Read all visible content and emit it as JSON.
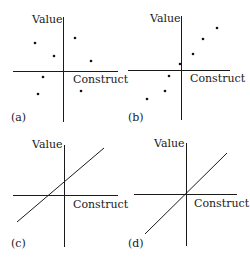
{
  "figure": {
    "y_axis_label": "Value",
    "x_axis_label": "Construct",
    "panels": [
      {
        "id": "a",
        "label": "(a)",
        "type": "scatter",
        "description": "no relationship",
        "axes": {
          "vx": 63,
          "vy1": 17,
          "vy2": 122,
          "hy": 71,
          "hx1": 13,
          "hx2": 118
        },
        "value_label_pos": {
          "x": 32,
          "y": 23
        },
        "construct_label_pos": {
          "x": 73,
          "y": 83
        },
        "panel_label_pos": {
          "x": 11,
          "y": 121
        },
        "points": [
          [
            35,
            43
          ],
          [
            54,
            56
          ],
          [
            75,
            38
          ],
          [
            91,
            61
          ],
          [
            43,
            77
          ],
          [
            38,
            94
          ],
          [
            81,
            91
          ]
        ]
      },
      {
        "id": "b",
        "label": "(b)",
        "type": "scatter",
        "description": "positive correlation",
        "axes": {
          "vx": 181,
          "vy1": 16,
          "vy2": 120,
          "hy": 70,
          "hx1": 128,
          "hx2": 230
        },
        "value_label_pos": {
          "x": 150,
          "y": 22
        },
        "construct_label_pos": {
          "x": 190,
          "y": 82
        },
        "panel_label_pos": {
          "x": 128,
          "y": 121
        },
        "points": [
          [
            217,
            28
          ],
          [
            203,
            39
          ],
          [
            193,
            54
          ],
          [
            180,
            64
          ],
          [
            169,
            76
          ],
          [
            165,
            91
          ],
          [
            147,
            99
          ]
        ]
      },
      {
        "id": "c",
        "label": "(c)",
        "type": "line",
        "description": "linear, positive intercept",
        "axes": {
          "vx": 64,
          "vy1": 145,
          "vy2": 247,
          "hy": 195,
          "hx1": 13,
          "hx2": 118
        },
        "value_label_pos": {
          "x": 32,
          "y": 148
        },
        "construct_label_pos": {
          "x": 73,
          "y": 208
        },
        "panel_label_pos": {
          "x": 11,
          "y": 247
        },
        "line": [
          [
            17,
            222
          ],
          [
            104,
            148
          ]
        ]
      },
      {
        "id": "d",
        "label": "(d)",
        "type": "line",
        "description": "linear through origin",
        "axes": {
          "vx": 186,
          "vy1": 143,
          "vy2": 246,
          "hy": 194,
          "hx1": 134,
          "hx2": 237
        },
        "value_label_pos": {
          "x": 154,
          "y": 147
        },
        "construct_label_pos": {
          "x": 194,
          "y": 207
        },
        "panel_label_pos": {
          "x": 128,
          "y": 247
        },
        "line": [
          [
            145,
            234
          ],
          [
            227,
            153
          ]
        ]
      }
    ]
  }
}
